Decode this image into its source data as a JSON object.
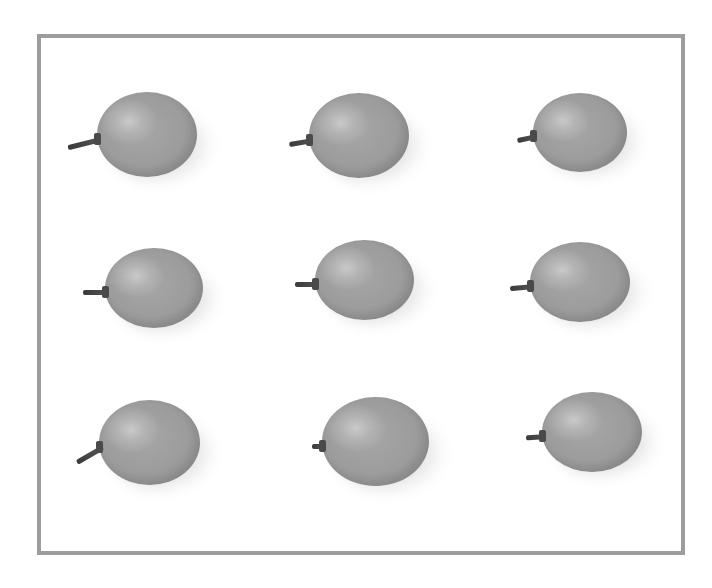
{
  "image": {
    "description": "Nine grapes arranged in a 3x3 grid on a white background inside a gray border (grayscale)",
    "frame_border_color": "#9d9d9d",
    "background_color": "#ffffff",
    "grape_color": "#9c9c9c",
    "grapes": [
      {
        "row": 1,
        "col": 1,
        "x": 97,
        "y": 92,
        "w": 100,
        "h": 85,
        "stem_len": 34,
        "stem_angle": -14
      },
      {
        "row": 1,
        "col": 2,
        "x": 309,
        "y": 93,
        "w": 100,
        "h": 85,
        "stem_len": 24,
        "stem_angle": -10
      },
      {
        "row": 1,
        "col": 3,
        "x": 533,
        "y": 93,
        "w": 94,
        "h": 79,
        "stem_len": 20,
        "stem_angle": -12
      },
      {
        "row": 2,
        "col": 1,
        "x": 105,
        "y": 248,
        "w": 98,
        "h": 80,
        "stem_len": 26,
        "stem_angle": 0
      },
      {
        "row": 2,
        "col": 2,
        "x": 315,
        "y": 240,
        "w": 99,
        "h": 80,
        "stem_len": 24,
        "stem_angle": 0
      },
      {
        "row": 2,
        "col": 3,
        "x": 530,
        "y": 242,
        "w": 100,
        "h": 80,
        "stem_len": 24,
        "stem_angle": -5
      },
      {
        "row": 3,
        "col": 1,
        "x": 99,
        "y": 400,
        "w": 101,
        "h": 85,
        "stem_len": 30,
        "stem_angle": -30
      },
      {
        "row": 3,
        "col": 2,
        "x": 322,
        "y": 397,
        "w": 107,
        "h": 89,
        "stem_len": 14,
        "stem_angle": 0
      },
      {
        "row": 3,
        "col": 3,
        "x": 542,
        "y": 392,
        "w": 100,
        "h": 80,
        "stem_len": 20,
        "stem_angle": -4
      }
    ]
  }
}
